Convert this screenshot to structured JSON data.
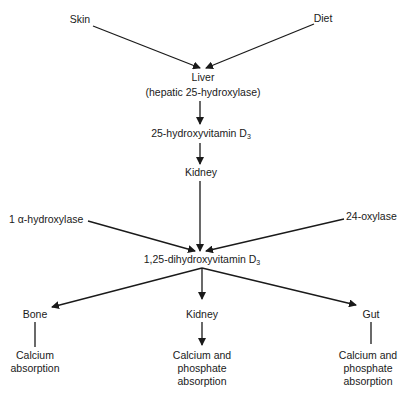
{
  "diagram": {
    "nodes": {
      "skin": "Skin",
      "diet": "Diet",
      "liver": "Liver",
      "liver_enzyme": "(hepatic 25-hydroxylase)",
      "hydroxyvitamin_prefix": "25-hydroxyvitamin D",
      "hydroxyvitamin_sub": "3",
      "kidney_top": "Kidney",
      "one_alpha": "1 α-hydroxylase",
      "oxylase": "24-oxylase",
      "dihydroxy_prefix": "1,25-dihydroxyvitamin D",
      "dihydroxy_sub": "3",
      "bone": "Bone",
      "kidney_bottom": "Kidney",
      "gut": "Gut",
      "bone_effect_1": "Calcium",
      "bone_effect_2": "absorption",
      "kidney_effect_1": "Calcium and",
      "kidney_effect_2": "phosphate",
      "kidney_effect_3": "absorption",
      "gut_effect_1": "Calcium and",
      "gut_effect_2": "phosphate",
      "gut_effect_3": "absorption"
    },
    "edges": [
      {
        "from": "Skin",
        "to": "Liver"
      },
      {
        "from": "Diet",
        "to": "Liver"
      },
      {
        "from": "Liver",
        "to": "25-hydroxyvitamin D3"
      },
      {
        "from": "25-hydroxyvitamin D3",
        "to": "Kidney"
      },
      {
        "from": "Kidney",
        "to": "1,25-dihydroxyvitamin D3"
      },
      {
        "from": "1 α-hydroxylase",
        "to": "1,25-dihydroxyvitamin D3"
      },
      {
        "from": "24-oxylase",
        "to": "1,25-dihydroxyvitamin D3"
      },
      {
        "from": "1,25-dihydroxyvitamin D3",
        "to": "Bone"
      },
      {
        "from": "1,25-dihydroxyvitamin D3",
        "to": "Kidney (effect)"
      },
      {
        "from": "1,25-dihydroxyvitamin D3",
        "to": "Gut"
      },
      {
        "from": "Bone",
        "to": "Calcium absorption",
        "arrow": false
      },
      {
        "from": "Kidney (effect)",
        "to": "Calcium and phosphate absorption"
      },
      {
        "from": "Gut",
        "to": "Calcium and phosphate absorption",
        "arrow": false
      }
    ],
    "colors": {
      "line": "#1a1a1a",
      "background": "#ffffff"
    }
  }
}
